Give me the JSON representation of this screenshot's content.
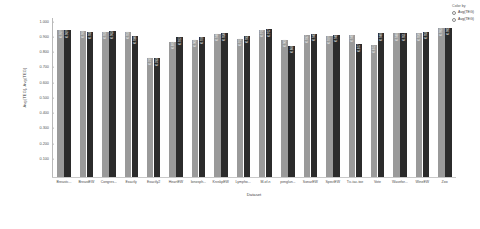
{
  "legend": {
    "title": "Color by",
    "entries": [
      {
        "label": "Avg(TEG)",
        "color": "#9a9a9a"
      },
      {
        "label": "Avg(TEG)",
        "color": "#2b2b2b"
      }
    ]
  },
  "chart_data": {
    "type": "bar",
    "title": "",
    "xlabel": "Dataset",
    "ylabel": "Avg(TEG), Avg(TEG)",
    "ylim": [
      0.0,
      1.05
    ],
    "grid": false,
    "legend_position": "top-right",
    "yticks": [
      "1.000",
      "0.900",
      "0.800",
      "0.700",
      "0.600",
      "0.500",
      "0.400",
      "0.300",
      "0.200",
      "0.100"
    ],
    "categories": [
      "Breastc...",
      "BreastEW",
      "Congres...",
      "Exactly",
      "Exactly2",
      "HeartEW",
      "Ionosph...",
      "KrvskpEW",
      "Lympho...",
      "M-of-n",
      "penglun...",
      "SonarEW",
      "SpectEW",
      "Tic-tac-toe",
      "Vote",
      "Wavefor...",
      "WineEW",
      "Zoo"
    ],
    "series": [
      {
        "name": "Avg(TEG)",
        "color": "#9a9a9a",
        "values": [
          0.969,
          0.966,
          0.958,
          0.958,
          0.789,
          0.893,
          0.908,
          0.946,
          0.913,
          0.971,
          0.908,
          0.937,
          0.929,
          0.941,
          0.872,
          0.948,
          0.95,
          0.983
        ],
        "labels": [
          "0.969",
          "0.966",
          "0.958",
          "0.958",
          "0.789",
          "0.893",
          "0.908",
          "0.946",
          "0.913",
          "0.971",
          "0.908",
          "0.937",
          "0.929",
          "0.941",
          "0.872",
          "0.948",
          "0.950",
          "0.983"
        ]
      },
      {
        "name": "Avg(TEG)",
        "color": "#2b2b2b",
        "values": [
          0.969,
          0.958,
          0.963,
          0.93,
          0.783,
          0.922,
          0.926,
          0.95,
          0.933,
          0.977,
          0.866,
          0.945,
          0.941,
          0.877,
          0.948,
          0.951,
          0.958,
          0.985
        ],
        "labels": [
          "0.969",
          "0.958",
          "0.963",
          "0.930",
          "0.783",
          "0.922",
          "0.926",
          "0.950",
          "0.933",
          "0.977",
          "0.866",
          "0.945",
          "0.941",
          "0.877",
          "0.948",
          "0.951",
          "0.958",
          "0.985"
        ]
      }
    ]
  }
}
